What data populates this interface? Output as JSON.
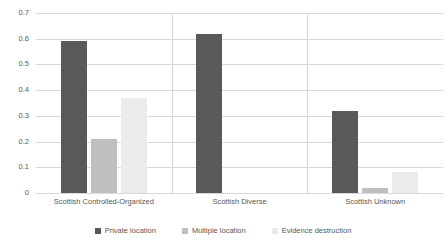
{
  "chart_data": {
    "type": "bar",
    "title": "",
    "subtitle": "",
    "xlabel": "",
    "ylabel": "",
    "ylim": [
      0,
      0.7
    ],
    "ytick_labels": [
      "0",
      "0.1",
      "0.2",
      "0.3",
      "0.4",
      "0.5",
      "0.6",
      "0.7"
    ],
    "ytick_values": [
      0,
      0.1,
      0.2,
      0.3,
      0.4,
      0.5,
      0.6,
      0.7
    ],
    "grid": "horizontal",
    "legend_position": "bottom",
    "categories": [
      "Scottish Controlled-Organized",
      "Scottish Diverse",
      "Scottish Unknown"
    ],
    "series": [
      {
        "name": "Private location",
        "color": "#595959",
        "values": [
          0.59,
          0.62,
          0.32
        ]
      },
      {
        "name": "Multiple location",
        "color": "#bfbfbf",
        "values": [
          0.21,
          0,
          0.02
        ]
      },
      {
        "name": "Evidence destruction",
        "color": "#ebebeb",
        "values": [
          0.37,
          0,
          0.08
        ]
      }
    ]
  }
}
